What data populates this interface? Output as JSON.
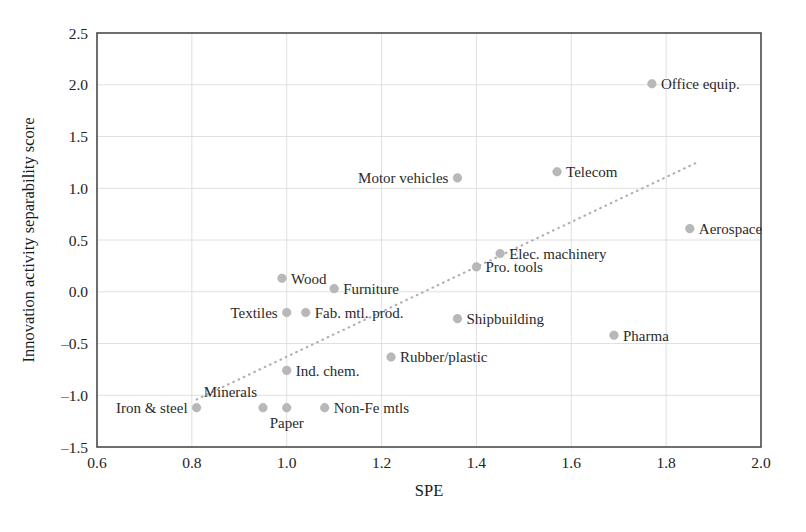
{
  "chart_data": {
    "type": "scatter",
    "title": "",
    "xlabel": "SPE",
    "ylabel": "Innovation activity separability score",
    "xlim": [
      0.6,
      2.0
    ],
    "ylim": [
      -1.5,
      2.5
    ],
    "xticks": [
      "0.6",
      "0.8",
      "1.0",
      "1.2",
      "1.4",
      "1.6",
      "1.8",
      "2.0"
    ],
    "xtick_values": [
      0.6,
      0.8,
      1.0,
      1.2,
      1.4,
      1.6,
      1.8,
      2.0
    ],
    "yticks": [
      "2.5",
      "2.0",
      "1.5",
      "1.0",
      "0.5",
      "0.0",
      "-0.5",
      "-1.0",
      "-1.5"
    ],
    "ytick_values": [
      2.5,
      2.0,
      1.5,
      1.0,
      0.5,
      0.0,
      -0.5,
      -1.0,
      -1.5
    ],
    "grid": true,
    "legend": "none",
    "marker_color": "#b8b8b8",
    "trendline_color": "#b0b0b0",
    "trendline": {
      "style": "dotted",
      "x0": 0.81,
      "y0": -1.04,
      "x1": 1.87,
      "y1": 1.26
    },
    "points": [
      {
        "label": "Office equip.",
        "x": 1.77,
        "y": 2.01,
        "label_pos": "right"
      },
      {
        "label": "Telecom",
        "x": 1.57,
        "y": 1.16,
        "label_pos": "right"
      },
      {
        "label": "Motor vehicles",
        "x": 1.36,
        "y": 1.1,
        "label_pos": "left"
      },
      {
        "label": "Aerospace",
        "x": 1.85,
        "y": 0.61,
        "label_pos": "right"
      },
      {
        "label": "Elec. machinery",
        "x": 1.45,
        "y": 0.37,
        "label_pos": "right"
      },
      {
        "label": "Pro. tools",
        "x": 1.4,
        "y": 0.24,
        "label_pos": "right"
      },
      {
        "label": "Wood",
        "x": 0.99,
        "y": 0.13,
        "label_pos": "right"
      },
      {
        "label": "Furniture",
        "x": 1.1,
        "y": 0.03,
        "label_pos": "right"
      },
      {
        "label": "Textiles",
        "x": 1.0,
        "y": -0.2,
        "label_pos": "left"
      },
      {
        "label": "Fab. mtl. prod.",
        "x": 1.04,
        "y": -0.2,
        "label_pos": "right"
      },
      {
        "label": "Shipbuilding",
        "x": 1.36,
        "y": -0.26,
        "label_pos": "right"
      },
      {
        "label": "Pharma",
        "x": 1.69,
        "y": -0.42,
        "label_pos": "right"
      },
      {
        "label": "Rubber/plastic",
        "x": 1.22,
        "y": -0.63,
        "label_pos": "right"
      },
      {
        "label": "Ind. chem.",
        "x": 1.0,
        "y": -0.76,
        "label_pos": "right"
      },
      {
        "label": "Iron & steel",
        "x": 0.81,
        "y": -1.12,
        "label_pos": "left"
      },
      {
        "label": "Minerals",
        "x": 0.95,
        "y": -1.12,
        "label_pos": "above-right"
      },
      {
        "label": "Paper",
        "x": 1.0,
        "y": -1.12,
        "label_pos": "below"
      },
      {
        "label": "Non-Fe mtls",
        "x": 1.08,
        "y": -1.12,
        "label_pos": "right"
      }
    ]
  }
}
